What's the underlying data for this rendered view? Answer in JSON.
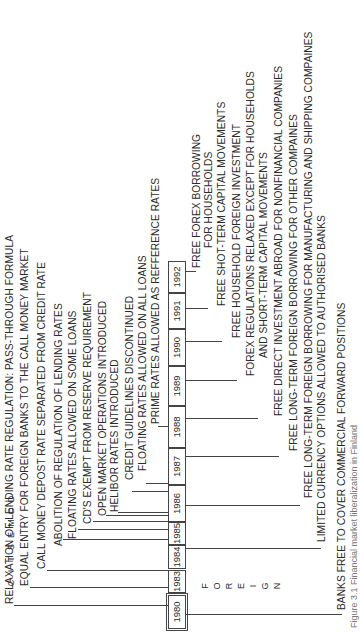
{
  "diagram": {
    "type": "timeline",
    "orientation": "rotated-90-ccw",
    "side_labels": {
      "domestic": [
        "D",
        "O",
        "M",
        "E",
        "S",
        "T",
        "I",
        "C"
      ],
      "foreign": [
        "F",
        "O",
        "R",
        "E",
        "I",
        "G",
        "N"
      ]
    },
    "years": [
      "1980",
      "1983",
      "1984",
      "1985",
      "1986",
      "1987",
      "1988",
      "1989",
      "1990",
      "1991",
      "1992"
    ],
    "domestic_events": [
      "RELAXATION OF LENDING RATE REGULATION: PASS-THROUGH FORMULA",
      "EQUAL ENTRY FOR FOREIGN BANKS TO THE CALL MONEY MARKET",
      "CALL MONEY DEPOST RATE SEPARATED FROM CREDIT RATE",
      "ABOLITION OF REGULATION OF LENDING RATES",
      "FLOATING RATES ALLOWED ON SOME LOANS",
      "CD'S EXEMPT FROM RESERVE REQUIREMENT",
      "OPEN MARKET OPERATIONS INTRODUCED",
      "HELIBOR RATES INTRODUCED",
      "CREDIT GUIDELINES DISCONTINUED",
      "FLOATING RATES ALLOWED ON ALL LOANS",
      "PRIME RATES ALLOWED AS REFFERENCE RATES"
    ],
    "foreign_events": [
      "FREE FOREX BORROWING",
      "FOR HOUSEHOLDS",
      "FREE SHOT-TERM CAPITAL MOVEMENTS",
      "FREE HOUSEHOLD FOREIGN INVESTMENT",
      "FOREX REGULATIONS RELAXED EXCEPT FOR HOUSEHOLDS",
      "AND SHORT-TERM CAPITAL MOVEMENTS",
      "FREE DIRECT INVESTMENT ABROAD FOR NONFINANCIAL COMPANIES",
      "FREE LONG-TERM FOREIGN BORROWING FOR OTHER COMPAINES",
      "FREE LONG-TERM FOREIGN BORROWING FOR MANUFACTURING AND SHIPPING COMPAINES",
      "LIMITED CURRENCY OPTIONS ALLOWED TO AUTHORISED BANKS",
      "BANKS FREE TO COVER COMMERCIAL FORWARD POSITIONS"
    ],
    "caption": "Figure 3.1  Financial market liberalization in Finland"
  }
}
